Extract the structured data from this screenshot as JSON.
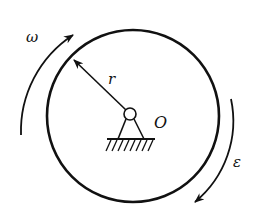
{
  "diagram": {
    "stroke_color": "#111111",
    "background": "#ffffff",
    "disk": {
      "cx": 133,
      "cy": 116,
      "r": 86
    },
    "pivot": {
      "cx": 130,
      "cy": 114,
      "r": 6
    },
    "labels": {
      "omega": "ω",
      "radius": "r",
      "center": "O",
      "epsilon": "ε"
    },
    "annotations": {
      "omega_desc": "angular velocity (clockwise)",
      "epsilon_desc": "angular acceleration (clockwise)",
      "radius_desc": "radius from center O to rim"
    }
  }
}
